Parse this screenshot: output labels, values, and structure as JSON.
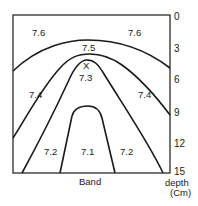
{
  "diagram": {
    "type": "contour-profile",
    "x_axis_label": "Band",
    "y_axis_label_line1": "depth",
    "y_axis_label_line2": "(Cm)",
    "depth_ticks": [
      "0",
      "3",
      "6",
      "9",
      "12",
      "15"
    ],
    "marker": "X",
    "contour_labels": {
      "top_left": "7.6",
      "top_right": "7.6",
      "band_75": "7.5",
      "band_73": "7.3",
      "left_74": "7.4",
      "right_74": "7.4",
      "left_72": "7.2",
      "center_71": "7.1",
      "right_72": "7.2"
    },
    "colors": {
      "line": "#1a1a1a",
      "background": "#ffffff"
    }
  }
}
